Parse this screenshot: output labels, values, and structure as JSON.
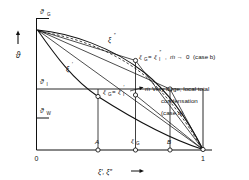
{
  "figure": {
    "type": "thermodynamic-equilibrium-diagram",
    "axes": {
      "y_axis": {
        "label": "ϑ",
        "arrow": "up",
        "ticks": [
          {
            "id": "theta-G",
            "label": "ϑ",
            "sub": "G",
            "position": "top"
          },
          {
            "id": "theta-I",
            "label": "ϑ",
            "sub": "I",
            "position": "middle"
          },
          {
            "id": "theta-W",
            "label": "ϑ",
            "sub": "W",
            "position": "lower"
          }
        ]
      },
      "x_axis": {
        "label": "ξ′, ξ″",
        "arrow": "right",
        "ticks": [
          {
            "id": "origin",
            "label": "0",
            "value": 0
          },
          {
            "id": "point-A",
            "label": "A",
            "value": 0.33
          },
          {
            "id": "xi-G",
            "label": "ξ",
            "sub": "G",
            "value": 0.56
          },
          {
            "id": "point-B",
            "label": "B",
            "value": 0.78
          },
          {
            "id": "unity",
            "label": "1",
            "value": 1
          }
        ]
      }
    },
    "curves": [
      {
        "id": "dew-curve",
        "label": "ξ",
        "prime": "″",
        "style": "solid"
      },
      {
        "id": "boiling-curve",
        "label": "ξ",
        "prime": "′",
        "style": "solid"
      },
      {
        "id": "tie-line-dashed",
        "label": "",
        "style": "dashed"
      }
    ],
    "annotations": [
      {
        "id": "case-b-label",
        "eq_left": "ξ",
        "eq_left_sub": "G",
        "eq_right": "ξ",
        "eq_right_sub": "I",
        "eq_right_prime": "″",
        "flux": "ṁ",
        "arrow": "→",
        "limit": "0",
        "case": "(case b)",
        "text": "ξ = ξ″,  ṁ → 0 (case b)"
      },
      {
        "id": "case-a-label",
        "eq_left": "ξ",
        "eq_left_sub": "G",
        "eq_right": "ξ",
        "eq_right_sub": "I",
        "eq_right_prime": "′",
        "flux": "ṁ",
        "line1": "Very large, local total",
        "line2": "condensation",
        "line3": "(case a)"
      }
    ]
  }
}
